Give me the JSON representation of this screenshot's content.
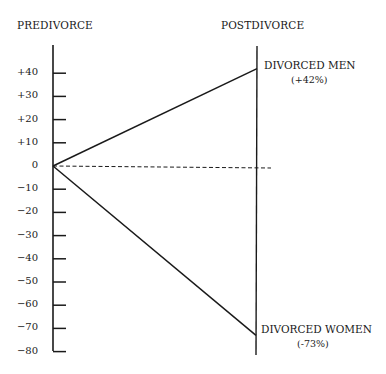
{
  "chart_data": {
    "type": "line",
    "title": "",
    "x": [
      "PREDIVORCE",
      "POSTDIVORCE"
    ],
    "xlabel": "",
    "ylabel": "",
    "ylim": [
      -80,
      40
    ],
    "yticks": [
      "+40",
      "+30",
      "+20",
      "+10",
      "0",
      "-10",
      "-20",
      "-30",
      "-40",
      "-50",
      "-60",
      "-70",
      "-80"
    ],
    "grid": false,
    "baseline": {
      "value": 0,
      "style": "dashed"
    },
    "series": [
      {
        "name": "DIVORCED MEN",
        "label": "(+42%)",
        "values": [
          0,
          42
        ]
      },
      {
        "name": "DIVORCED WOMEN",
        "label": "(-73%)",
        "values": [
          0,
          -73
        ]
      }
    ]
  },
  "labels": {
    "left_axis": "PREDIVORCE",
    "right_axis": "POSTDIVORCE",
    "men_name": "DIVORCED MEN",
    "men_value": "(+42%)",
    "women_name": "DIVORCED WOMEN",
    "women_value": "(-73%)"
  }
}
